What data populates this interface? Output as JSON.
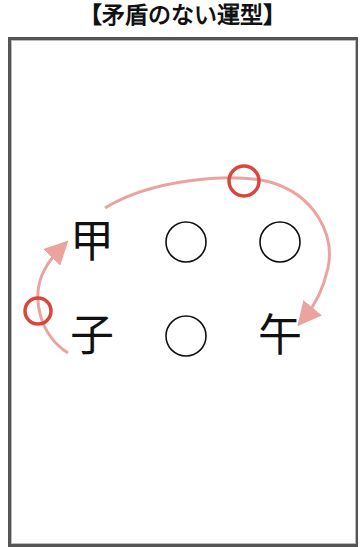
{
  "title": "【矛盾のない運型】",
  "grid": {
    "row1": [
      "甲",
      "○",
      "○"
    ],
    "row2": [
      "子",
      "○",
      "午"
    ]
  },
  "colors": {
    "arrow": "#eba3a0",
    "marker": "#d9463b",
    "text": "#111111",
    "frame": "#555555"
  }
}
